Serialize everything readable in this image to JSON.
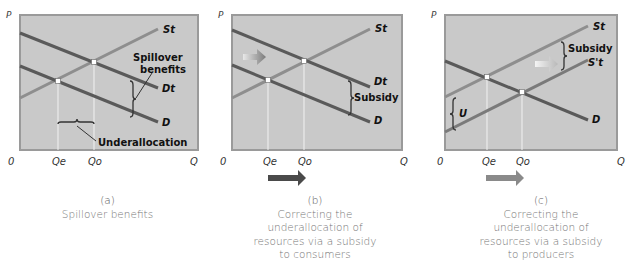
{
  "colors": {
    "panel_bg": "#c9c9c9",
    "panel_border": "#9a9a9a",
    "demand_line": "#5a5a5a",
    "supply_line": "#8e8e8e",
    "arrow_dark": "#4a4a4a",
    "arrow_light": "#8a8a8a"
  },
  "panels": [
    {
      "id": "a",
      "axis": {
        "y_label": "P",
        "x_label": "Q",
        "origin": "0",
        "qe": "Qe",
        "qo": "Qo"
      },
      "curves": {
        "supply": "St",
        "demand_total": "Dt",
        "demand": "D"
      },
      "annotations": {
        "spillover_line1": "Spillover",
        "spillover_line2": "benefits",
        "underallocation": "Underallocation"
      },
      "caption": {
        "letter": "(a)",
        "lines": [
          "Spillover benefits"
        ]
      }
    },
    {
      "id": "b",
      "axis": {
        "y_label": "P",
        "x_label": "Q",
        "origin": "0",
        "qe": "Qe",
        "qo": "Qo"
      },
      "curves": {
        "supply": "St",
        "demand_total": "Dt",
        "demand": "D"
      },
      "annotations": {
        "subsidy": "Subsidy"
      },
      "caption": {
        "letter": "(b)",
        "lines": [
          "Correcting the",
          "underallocation of",
          "resources via a subsidy",
          "to consumers"
        ]
      }
    },
    {
      "id": "c",
      "axis": {
        "y_label": "P",
        "x_label": "Q",
        "origin": "0",
        "qe": "Qe",
        "qo": "Qo"
      },
      "curves": {
        "supply": "St",
        "supply_shifted": "S't",
        "demand": "D"
      },
      "annotations": {
        "subsidy": "Subsidy",
        "u": "U"
      },
      "caption": {
        "letter": "(c)",
        "lines": [
          "Correcting the",
          "underallocation of",
          "resources via a subsidy",
          "to producers"
        ]
      }
    }
  ]
}
